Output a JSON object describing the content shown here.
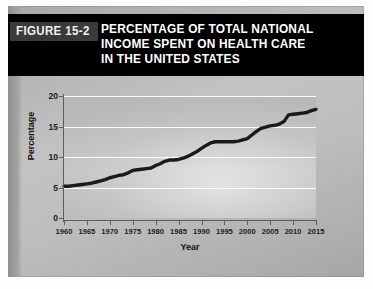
{
  "figure": {
    "tab_label": "FIGURE 15-2",
    "title_lines": [
      "PERCENTAGE OF TOTAL NATIONAL",
      "INCOME SPENT ON HEALTH CARE",
      "IN THE UNITED STATES"
    ]
  },
  "colors": {
    "banner_background": "#000000",
    "tab_background": "#3b3b3b",
    "banner_text": "#ffffff",
    "panel_background": "#bababa",
    "plot_background": "#bdbdbd",
    "gridline": "#ffffff",
    "axis": "#5e5e5e",
    "series_line": "#1a1a1a"
  },
  "chart_data": {
    "type": "line",
    "title": "PERCENTAGE OF TOTAL NATIONAL INCOME SPENT ON HEALTH CARE IN THE UNITED STATES",
    "xlabel": "Year",
    "ylabel": "Percentage",
    "xlim": [
      1960,
      2015
    ],
    "ylim": [
      0,
      20
    ],
    "xticks": [
      1960,
      1965,
      1970,
      1975,
      1980,
      1985,
      1990,
      1995,
      2000,
      2005,
      2010,
      2015
    ],
    "yticks": [
      0,
      5,
      10,
      15,
      20
    ],
    "xtick_labels": [
      "1960",
      "1965",
      "1970",
      "1975",
      "1980",
      "1985",
      "1990",
      "1995",
      "2000",
      "2005",
      "2010",
      "2015"
    ],
    "ytick_labels": [
      "0",
      "5",
      "10",
      "15",
      "20"
    ],
    "grid": "horizontal",
    "legend": "none",
    "series": [
      {
        "name": "Health care share of national income",
        "x": [
          1960,
          1961,
          1962,
          1963,
          1964,
          1965,
          1966,
          1967,
          1968,
          1969,
          1970,
          1971,
          1972,
          1973,
          1974,
          1975,
          1976,
          1977,
          1978,
          1979,
          1980,
          1981,
          1982,
          1983,
          1984,
          1985,
          1986,
          1987,
          1988,
          1989,
          1990,
          1991,
          1992,
          1993,
          1994,
          1995,
          1996,
          1997,
          1998,
          1999,
          2000,
          2001,
          2002,
          2003,
          2004,
          2005,
          2006,
          2007,
          2008,
          2009,
          2010,
          2011,
          2012,
          2013,
          2014,
          2015
        ],
        "values": [
          5.2,
          5.2,
          5.3,
          5.4,
          5.5,
          5.6,
          5.7,
          5.9,
          6.1,
          6.3,
          6.6,
          6.8,
          7.0,
          7.1,
          7.4,
          7.8,
          7.9,
          8.0,
          8.1,
          8.2,
          8.6,
          8.9,
          9.3,
          9.5,
          9.5,
          9.6,
          9.8,
          10.1,
          10.5,
          10.9,
          11.4,
          11.9,
          12.3,
          12.5,
          12.5,
          12.5,
          12.5,
          12.5,
          12.6,
          12.8,
          13.0,
          13.6,
          14.2,
          14.7,
          14.9,
          15.1,
          15.2,
          15.4,
          15.8,
          16.9,
          17.0,
          17.1,
          17.2,
          17.3,
          17.6,
          17.8
        ]
      }
    ]
  }
}
